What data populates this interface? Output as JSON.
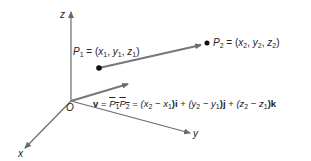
{
  "diagram": {
    "axes": {
      "z_label": "z",
      "x_label": "x",
      "y_label": "y",
      "origin_label": "O"
    },
    "points": {
      "p1": {
        "name": "P",
        "sub": "1",
        "eq": "= (",
        "coords": [
          {
            "v": "x",
            "s": "1"
          },
          {
            "v": "y",
            "s": "1"
          },
          {
            "v": "z",
            "s": "1"
          }
        ]
      },
      "p2": {
        "name": "P",
        "sub": "2",
        "eq": "= (",
        "coords": [
          {
            "v": "x",
            "s": "2"
          },
          {
            "v": "y",
            "s": "2"
          },
          {
            "v": "z",
            "s": "2"
          }
        ]
      }
    },
    "equation": {
      "lhs": "v",
      "equals": "=",
      "vec_p1": "P",
      "vec_p1_sub": "1",
      "vec_p2": "P",
      "vec_p2_sub": "2",
      "term1": "(x",
      "term1_a": "2",
      "term1_b": " − x",
      "term1_c": "1",
      "term1_unit": ")i",
      "plus1": " + ",
      "term2": "(y",
      "term2_a": "2",
      "term2_b": " − y",
      "term2_c": "1",
      "term2_unit": ")j",
      "plus2": " + ",
      "term3": "(z",
      "term3_a": "2",
      "term3_b": " − z",
      "term3_c": "1",
      "term3_unit": ")k"
    },
    "colors": {
      "axis": "#6b6b6b",
      "vector": "#707070",
      "point": "#111111",
      "text": "#222222"
    }
  }
}
